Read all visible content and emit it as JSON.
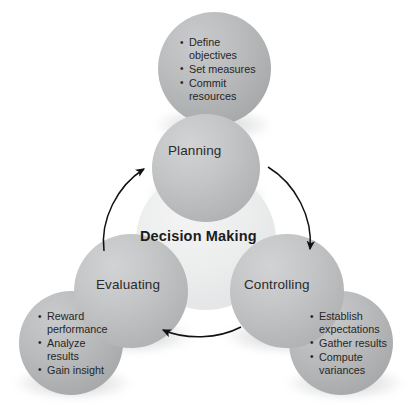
{
  "diagram": {
    "title": "Decision Making",
    "center": {
      "label": "Decision Making"
    },
    "nodes": [
      {
        "id": "planning",
        "label": "Planning",
        "bullets": [
          "Define\nobjectives",
          "Set measures",
          "Commit\nresources"
        ]
      },
      {
        "id": "controlling",
        "label": "Controlling",
        "bullets": [
          "Establish\nexpectations",
          "Gather results",
          "Compute\nvariances"
        ]
      },
      {
        "id": "evaluating",
        "label": "Evaluating",
        "bullets": [
          "Reward\nperformance",
          "Analyze\nresults",
          "Gain insight"
        ]
      }
    ],
    "arrows": [
      {
        "id": "evaluating-to-planning",
        "from": "evaluating",
        "to": "planning"
      },
      {
        "id": "planning-to-controlling",
        "from": "planning",
        "to": "controlling"
      },
      {
        "id": "controlling-to-evaluating",
        "from": "controlling",
        "to": "evaluating"
      }
    ],
    "colors": {
      "background": "#ffffff",
      "center_circle": "#ebecec",
      "role_circle": "#bcbdbe",
      "detail_circle": "#b1b2b3",
      "text": "#262626",
      "arrow": "#111111"
    }
  }
}
